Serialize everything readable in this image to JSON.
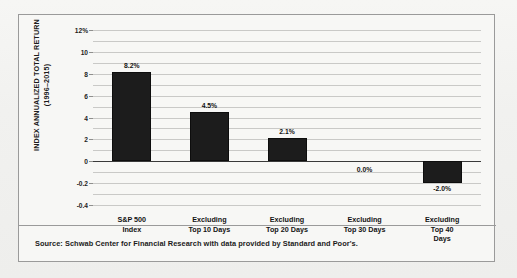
{
  "chart_data": {
    "type": "bar",
    "title": "",
    "xlabel": "",
    "ylabel": "INDEX ANNUALIZED TOTAL RETURN\n(1996–2015)",
    "ylabel_line1": "INDEX ANNUALIZED TOTAL RETURN",
    "ylabel_line2": "(1996–2015)",
    "categories": [
      "S&P 500\nIndex",
      "Excluding\nTop 10 Days",
      "Excluding\nTop 20 Days",
      "Excluding\nTop 30 Days",
      "Excluding\nTop 40 Days"
    ],
    "values": [
      8.2,
      4.5,
      2.1,
      0.0,
      -2.0
    ],
    "data_labels": [
      "8.2%",
      "4.5%",
      "2.1%",
      "0.0%",
      "-2.0%"
    ],
    "ytick_labels": [
      "12%",
      "10",
      "8",
      "6",
      "4",
      "2",
      "0",
      "-0.2",
      "-0.4"
    ],
    "ytick_values": [
      12,
      10,
      8,
      6,
      4,
      2,
      0,
      -2,
      -4
    ],
    "ylim": [
      -4,
      12
    ],
    "grid": true,
    "gridline_step": 1,
    "legend": "none",
    "bar_color": "#1c1c1c",
    "grid_color": "#c9c9c7",
    "axis_color": "#3a3a3a"
  },
  "footer": {
    "source": "Source: Schwab Center for Financial Research with data provided by Standard and Poor's."
  }
}
